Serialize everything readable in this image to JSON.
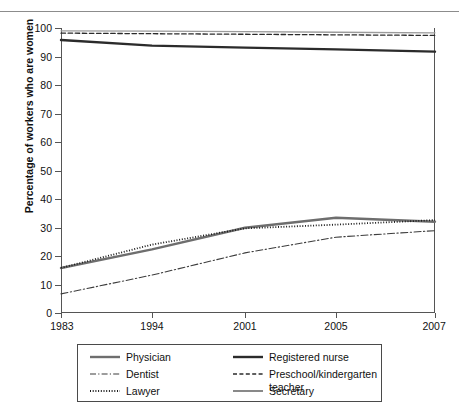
{
  "figure": {
    "top_partial_text": "",
    "x_axis_title": "Year",
    "y_axis_title": "Percentage of workers who are women"
  },
  "chart_data": {
    "type": "line",
    "title": "",
    "subtitle": "",
    "xlabel": "Year",
    "ylabel": "Percentage of workers who are women",
    "x": [
      1983,
      1994,
      2001,
      2005,
      2007
    ],
    "xtick_labels": [
      "1983",
      "1994",
      "2001",
      "2005",
      "2007"
    ],
    "xtick_positions": [
      1983,
      1994,
      2001,
      2005,
      2007
    ],
    "ytick_labels": [
      "0",
      "10",
      "20",
      "30",
      "40",
      "50",
      "60",
      "70",
      "80",
      "90",
      "100"
    ],
    "ytick_values": [
      0,
      10,
      20,
      30,
      40,
      50,
      60,
      70,
      80,
      90,
      100
    ],
    "ylim": [
      0,
      100
    ],
    "xlim": [
      1983,
      2007
    ],
    "grid": false,
    "legend_position": "below-plot",
    "series": [
      {
        "name": "Physician",
        "style": "solid",
        "color": "#6e6e6e",
        "width": 2.4,
        "values": [
          15.8,
          22.3,
          29.9,
          33.4,
          32.0
        ]
      },
      {
        "name": "Dentist",
        "style": "dashdot",
        "color": "#3d3d3d",
        "width": 1.1,
        "values": [
          6.7,
          13.3,
          21.1,
          26.6,
          28.9
        ]
      },
      {
        "name": "Lawyer",
        "style": "dotted",
        "color": "#1a1a1a",
        "width": 1.8,
        "values": [
          15.8,
          24.0,
          29.7,
          31.0,
          32.6
        ]
      },
      {
        "name": "Registered nurse",
        "style": "solid",
        "color": "#2b2b2b",
        "width": 2.4,
        "values": [
          95.8,
          93.8,
          93.1,
          92.5,
          91.7
        ]
      },
      {
        "name": "Preschool/kindergarten teacher",
        "style": "dashed",
        "color": "#2b2b2b",
        "width": 1.3,
        "values": [
          98.2,
          98.0,
          97.8,
          97.6,
          97.4
        ]
      },
      {
        "name": "Secretary",
        "style": "solid",
        "color": "#9b9b9b",
        "width": 1.3,
        "values": [
          99.0,
          98.9,
          98.7,
          98.5,
          98.3
        ]
      }
    ]
  },
  "legend": {
    "column1": [
      {
        "label": "Physician",
        "style": "solid-thick-gray"
      },
      {
        "label": "Dentist",
        "style": "dashdot"
      },
      {
        "label": "Lawyer",
        "style": "dotted"
      }
    ],
    "column2": [
      {
        "label": "Registered nurse",
        "style": "solid-thick-black"
      },
      {
        "label": "Preschool/kindergarten\nteacher",
        "style": "dashed"
      },
      {
        "label": "Secretary",
        "style": "solid-thin"
      }
    ]
  }
}
